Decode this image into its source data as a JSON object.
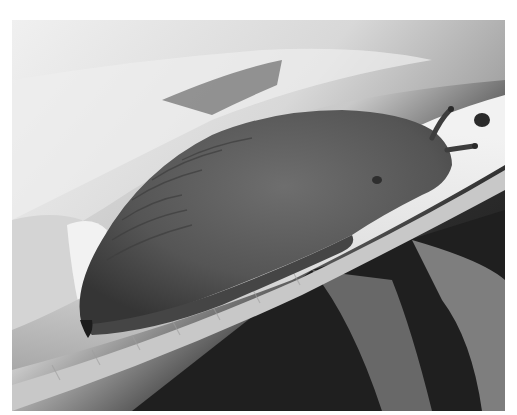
{
  "image": {
    "alt": "Grayscale photograph of a slug crawling along a celery stalk",
    "subject": "slug",
    "background": "celery leaves and stalks"
  },
  "colors": {
    "page_background": "#ffffff",
    "dark_background": "#1e1e1e",
    "celery_light": "#e8e8e8",
    "celery_mid": "#bdbdbd",
    "slug_body": "#5a5a5a",
    "slug_shadow": "#3c3c3c"
  }
}
